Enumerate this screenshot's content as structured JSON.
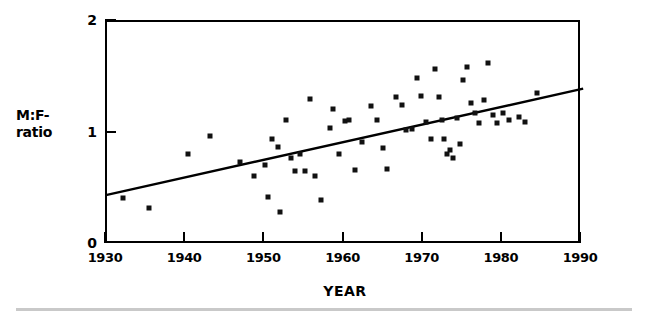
{
  "chart_data": {
    "type": "scatter",
    "title": "",
    "xlabel": "YEAR",
    "ylabel": "M:F-ratio",
    "ylabel_lines": [
      "M:F-",
      "ratio"
    ],
    "xlim": [
      1930,
      1990
    ],
    "ylim": [
      0,
      2
    ],
    "xticks": [
      1930,
      1940,
      1950,
      1960,
      1970,
      1980,
      1990
    ],
    "xticklabels": [
      "1930",
      "1940",
      "1950",
      "1960",
      "1970",
      "1980",
      "1990"
    ],
    "yticks": [
      0,
      1,
      2
    ],
    "yticklabels": [
      "0",
      "1",
      "2"
    ],
    "grid": false,
    "legend": null,
    "marker_color": "#111111",
    "line_color": "#000000",
    "frame_color": "#000000",
    "background_color": "#ffffff",
    "points": [
      {
        "x": 1932.0,
        "y": 0.42
      },
      {
        "x": 1935.3,
        "y": 0.33
      },
      {
        "x": 1940.2,
        "y": 0.82
      },
      {
        "x": 1943.0,
        "y": 0.98
      },
      {
        "x": 1946.8,
        "y": 0.74
      },
      {
        "x": 1948.6,
        "y": 0.62
      },
      {
        "x": 1950.0,
        "y": 0.72
      },
      {
        "x": 1950.3,
        "y": 0.43
      },
      {
        "x": 1950.9,
        "y": 0.95
      },
      {
        "x": 1951.6,
        "y": 0.88
      },
      {
        "x": 1951.9,
        "y": 0.3
      },
      {
        "x": 1952.6,
        "y": 1.12
      },
      {
        "x": 1953.2,
        "y": 0.78
      },
      {
        "x": 1953.8,
        "y": 0.66
      },
      {
        "x": 1954.4,
        "y": 0.82
      },
      {
        "x": 1955.0,
        "y": 0.66
      },
      {
        "x": 1955.6,
        "y": 1.31
      },
      {
        "x": 1956.3,
        "y": 0.62
      },
      {
        "x": 1957.0,
        "y": 0.4
      },
      {
        "x": 1958.2,
        "y": 1.05
      },
      {
        "x": 1958.6,
        "y": 1.22
      },
      {
        "x": 1959.3,
        "y": 0.82
      },
      {
        "x": 1960.0,
        "y": 1.11
      },
      {
        "x": 1960.6,
        "y": 1.12
      },
      {
        "x": 1961.3,
        "y": 0.67
      },
      {
        "x": 1962.2,
        "y": 0.92
      },
      {
        "x": 1963.4,
        "y": 1.25
      },
      {
        "x": 1964.1,
        "y": 1.12
      },
      {
        "x": 1964.8,
        "y": 0.87
      },
      {
        "x": 1965.4,
        "y": 0.68
      },
      {
        "x": 1966.5,
        "y": 1.33
      },
      {
        "x": 1967.2,
        "y": 1.26
      },
      {
        "x": 1967.8,
        "y": 1.03
      },
      {
        "x": 1968.5,
        "y": 1.04
      },
      {
        "x": 1969.1,
        "y": 1.5
      },
      {
        "x": 1969.7,
        "y": 1.34
      },
      {
        "x": 1970.3,
        "y": 1.1
      },
      {
        "x": 1970.9,
        "y": 0.95
      },
      {
        "x": 1971.4,
        "y": 1.58
      },
      {
        "x": 1971.9,
        "y": 1.33
      },
      {
        "x": 1972.3,
        "y": 1.12
      },
      {
        "x": 1972.6,
        "y": 0.95
      },
      {
        "x": 1972.9,
        "y": 0.82
      },
      {
        "x": 1973.3,
        "y": 0.85
      },
      {
        "x": 1973.7,
        "y": 0.78
      },
      {
        "x": 1974.2,
        "y": 1.14
      },
      {
        "x": 1974.6,
        "y": 0.91
      },
      {
        "x": 1975.0,
        "y": 1.48
      },
      {
        "x": 1975.5,
        "y": 1.6
      },
      {
        "x": 1976.0,
        "y": 1.27
      },
      {
        "x": 1976.5,
        "y": 1.18
      },
      {
        "x": 1977.0,
        "y": 1.09
      },
      {
        "x": 1977.6,
        "y": 1.3
      },
      {
        "x": 1978.1,
        "y": 1.63
      },
      {
        "x": 1978.7,
        "y": 1.17
      },
      {
        "x": 1979.3,
        "y": 1.09
      },
      {
        "x": 1980.0,
        "y": 1.18
      },
      {
        "x": 1980.8,
        "y": 1.12
      },
      {
        "x": 1982.0,
        "y": 1.15
      },
      {
        "x": 1982.8,
        "y": 1.1
      },
      {
        "x": 1984.3,
        "y": 1.36
      }
    ],
    "trendline": {
      "x_start": 1930,
      "y_start": 0.45,
      "x_end": 1990,
      "y_end": 1.4
    }
  }
}
